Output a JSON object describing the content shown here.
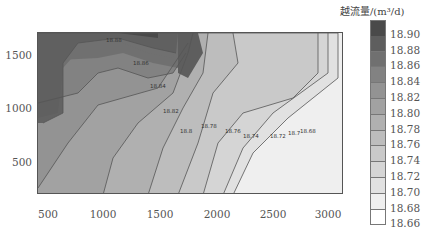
{
  "chart_data": {
    "type": "contour",
    "title": "",
    "xlabel": "",
    "ylabel": "",
    "xlim": [
      400,
      3150
    ],
    "ylim": [
      100,
      1700
    ],
    "x_ticks": [
      "500",
      "1000",
      "1500",
      "2000",
      "2500",
      "3000"
    ],
    "y_ticks": [
      "500",
      "1000",
      "1500"
    ],
    "colorbar": {
      "title": "越流量/(m³/d)",
      "levels": [
        "18.90",
        "18.88",
        "18.86",
        "18.84",
        "18.82",
        "18.80",
        "18.78",
        "18.76",
        "18.74",
        "18.72",
        "18.70",
        "18.68",
        "18.66"
      ],
      "colors": [
        "#4a4a4a",
        "#5e5e5e",
        "#707070",
        "#828282",
        "#939393",
        "#a2a2a2",
        "#b0b0b0",
        "#bdbdbd",
        "#c9c9c9",
        "#d5d5d5",
        "#e1e1e1",
        "#efefef",
        "#ffffff"
      ]
    },
    "contour_labels": [
      "18.88",
      "18.86",
      "18.84",
      "18.82",
      "18.8",
      "18.78",
      "18.76",
      "18.74",
      "18.72",
      "18.7",
      "18.68"
    ],
    "trend": "flow decreases from upper-left (~18.90) toward lower-right (~18.66)"
  },
  "caption": ""
}
